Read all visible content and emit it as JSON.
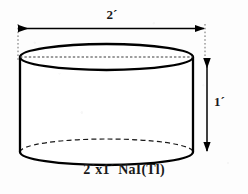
{
  "figure": {
    "kind": "technical-drawing",
    "caption": "2´x1´ NaI(Tl)",
    "background_color": "#fdfdfd",
    "ink_color": "#000000",
    "dimensions": {
      "width_label": "2´",
      "height_label": "1´",
      "width_value": 2,
      "height_value": 1,
      "unit": "´"
    },
    "geometry": {
      "cylinder_left_x": 20,
      "cylinder_right_x": 193,
      "top_ellipse_cy": 57,
      "bottom_ellipse_cy": 152,
      "ellipse_rx": 86.5,
      "ellipse_ry": 13,
      "width_dim_line_y": 28,
      "width_dim_x1": 18,
      "width_dim_x2": 205,
      "height_dim_line_x": 207,
      "height_dim_y1": 58,
      "height_dim_y2": 152
    },
    "annotations": {
      "top_face": "top-ellipse-solid",
      "top_diameter": "dashed-center-line",
      "bottom_back_arc": "dashed-hidden-edge",
      "bottom_front_arc": "solid-visible-edge"
    }
  }
}
